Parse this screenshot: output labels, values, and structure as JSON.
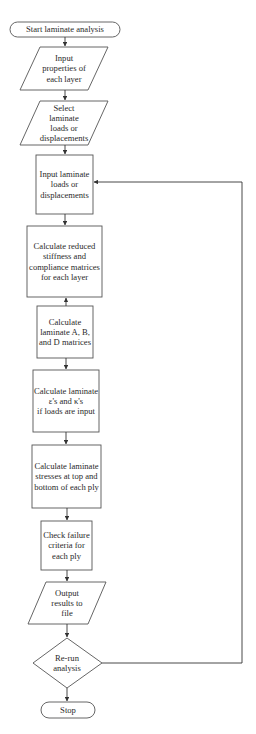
{
  "diagram": {
    "type": "flowchart",
    "colors": {
      "stroke": "#555555",
      "text": "#2a2a2a",
      "background": "#ffffff"
    },
    "nodes": [
      {
        "id": "start",
        "shape": "terminal",
        "label": "Start laminate analysis"
      },
      {
        "id": "input_props",
        "shape": "parallelogram",
        "label": "Input\nproperties of\neach layer"
      },
      {
        "id": "select_loads",
        "shape": "parallelogram",
        "label": "Select\nlaminate\nloads or\ndisplacements"
      },
      {
        "id": "input_loads",
        "shape": "rectangle",
        "label": "Input laminate\nloads or\ndisplacements"
      },
      {
        "id": "calc_reduced",
        "shape": "rectangle",
        "label": "Calculate reduced\nstiffness and\ncompliance matrices\nfor each layer"
      },
      {
        "id": "calc_abd",
        "shape": "rectangle",
        "label": "Calculate\nlaminate A, B,\nand D matrices"
      },
      {
        "id": "calc_strains",
        "shape": "rectangle",
        "label": "Calculate laminate\nε's and κ's\nif loads are input"
      },
      {
        "id": "calc_stresses",
        "shape": "rectangle",
        "label": "Calculate laminate\nstresses at top and\nbottom of each ply"
      },
      {
        "id": "check_failure",
        "shape": "rectangle",
        "label": "Check failure\ncriteria for\neach ply"
      },
      {
        "id": "output",
        "shape": "parallelogram",
        "label": "Output\nresults to\nfile"
      },
      {
        "id": "rerun",
        "shape": "diamond",
        "label": "Re-run\nanalysis"
      },
      {
        "id": "stop",
        "shape": "terminal",
        "label": "Stop"
      }
    ],
    "edges": [
      {
        "from": "start",
        "to": "input_props"
      },
      {
        "from": "input_props",
        "to": "select_loads"
      },
      {
        "from": "select_loads",
        "to": "input_loads"
      },
      {
        "from": "input_loads",
        "to": "calc_reduced"
      },
      {
        "from": "calc_abd",
        "to": "calc_reduced",
        "note": "arrow drawn pointing upward"
      },
      {
        "from": "calc_abd",
        "to": "calc_strains"
      },
      {
        "from": "calc_strains",
        "to": "calc_stresses"
      },
      {
        "from": "calc_stresses",
        "to": "check_failure"
      },
      {
        "from": "check_failure",
        "to": "output"
      },
      {
        "from": "output",
        "to": "rerun"
      },
      {
        "from": "rerun",
        "to": "stop"
      },
      {
        "from": "rerun",
        "to": "input_loads",
        "note": "loop back along right side"
      }
    ]
  }
}
